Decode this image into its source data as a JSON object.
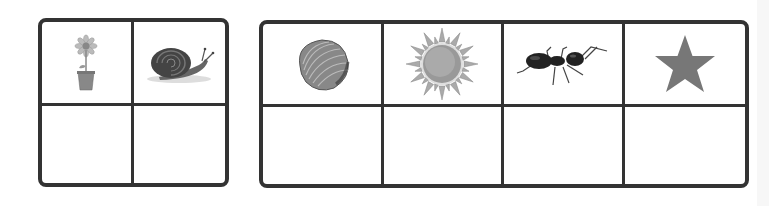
{
  "worksheet": {
    "left_grid": {
      "rows": 2,
      "cols": 2,
      "top_row": [
        {
          "icon": "flower-pot-icon",
          "label": "flower"
        },
        {
          "icon": "snail-icon",
          "label": "snail"
        }
      ],
      "bottom_row": [
        "",
        ""
      ]
    },
    "right_grid": {
      "rows": 2,
      "cols": 4,
      "top_row": [
        {
          "icon": "seashell-icon",
          "label": "shell"
        },
        {
          "icon": "sun-icon",
          "label": "sun"
        },
        {
          "icon": "ant-icon",
          "label": "ant"
        },
        {
          "icon": "star-icon",
          "label": "star"
        }
      ],
      "bottom_row": [
        "",
        "",
        "",
        ""
      ]
    }
  },
  "colors": {
    "border": "#333333",
    "star": "#777777",
    "sun": "#999999"
  }
}
